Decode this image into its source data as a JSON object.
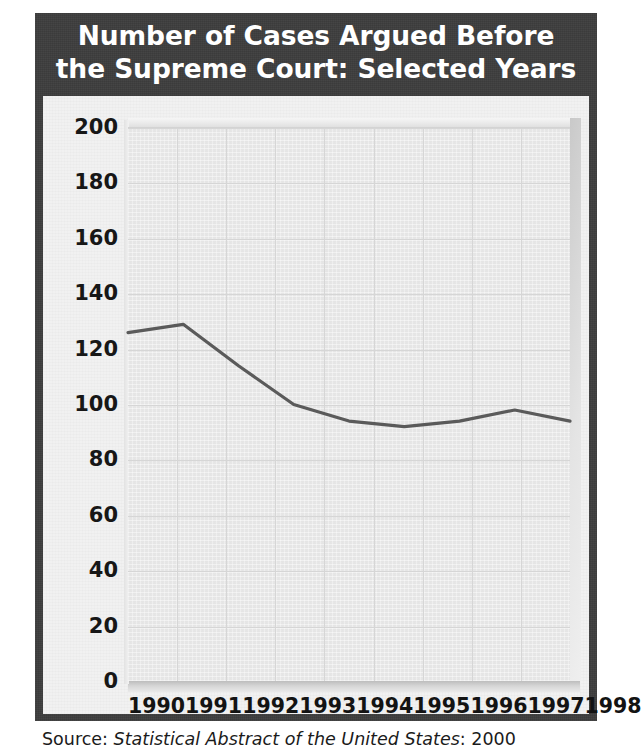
{
  "title": {
    "line1": "Number of Cases Argued Before",
    "line2": "the Supreme Court: Selected Years"
  },
  "source": {
    "prefix": "Source: ",
    "publication": "Statistical Abstract of the United States",
    "suffix": ": 2000"
  },
  "colors": {
    "frame": "#3d3d3d",
    "panel": "#f1f1f1",
    "plot": "#ebebeb",
    "grid": "#d6d6d6",
    "line": "#5a5a5a",
    "title_text": "#ffffff",
    "axis_text": "#171717"
  },
  "chart_data": {
    "type": "line",
    "title": "Number of Cases Argued Before the Supreme Court: Selected Years",
    "xlabel": "",
    "ylabel": "",
    "x": [
      "1990",
      "1991",
      "1992",
      "1993",
      "1994",
      "1995",
      "1996",
      "1997",
      "1998"
    ],
    "categories": [
      "1990",
      "1991",
      "1992",
      "1993",
      "1994",
      "1995",
      "1996",
      "1997",
      "1998"
    ],
    "values": [
      126,
      129,
      114,
      100,
      94,
      92,
      94,
      98,
      94
    ],
    "series": [
      {
        "name": "Cases argued",
        "values": [
          126,
          129,
          114,
          100,
          94,
          92,
          94,
          98,
          94
        ]
      }
    ],
    "ylim": [
      0,
      200
    ],
    "ytick_step": 20,
    "ytick_labels": [
      "200",
      "180",
      "160",
      "140",
      "120",
      "100",
      "80",
      "60",
      "40",
      "20",
      "0"
    ],
    "ytick_values": [
      200,
      180,
      160,
      140,
      120,
      100,
      80,
      60,
      40,
      20,
      0
    ],
    "grid": "horizontal-and-vertical",
    "legend": "none",
    "markers": "none"
  }
}
